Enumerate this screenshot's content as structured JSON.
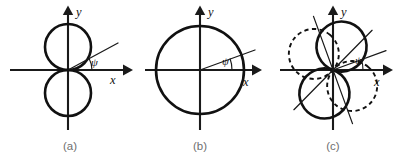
{
  "figure": {
    "background_color": "#ffffff",
    "stroke_color": "#111111",
    "caption_color": "#6f6f6f",
    "width": 401,
    "height": 159
  },
  "panels": [
    {
      "id": "panel-a",
      "caption": "(a)",
      "caption_x": 70,
      "caption_y": 150,
      "origin_x": 68,
      "origin_y": 70,
      "axes": {
        "x_label": "x",
        "y_label": "y",
        "x_label_x": 110,
        "x_label_y": 84,
        "y_label_x": 76,
        "y_label_y": 16,
        "x_start": 10,
        "x_end": 127,
        "y_start": 130,
        "y_end": 9
      },
      "angle_label": "ψ",
      "angle_label_x": 91,
      "angle_label_y": 66,
      "angle_degrees": 28,
      "ray_length": 54,
      "shape": {
        "type": "two-tangent-circles-vertical",
        "radius": 23,
        "upper_center_offset_y": -23,
        "lower_center_offset_y": 23,
        "rotation_degrees": 0
      }
    },
    {
      "id": "panel-b",
      "caption": "(b)",
      "caption_x": 200,
      "caption_y": 150,
      "origin_x": 200,
      "origin_y": 70,
      "axes": {
        "x_label": "x",
        "y_label": "y",
        "x_label_x": 243,
        "x_label_y": 86,
        "y_label_x": 208,
        "y_label_y": 16,
        "x_start": 145,
        "x_end": 258,
        "y_start": 130,
        "y_end": 9
      },
      "angle_label": "ψ",
      "angle_label_x": 222,
      "angle_label_y": 65,
      "angle_degrees": 20,
      "ray_length": 58,
      "shape": {
        "type": "circle-centered-origin",
        "radius": 44
      }
    },
    {
      "id": "panel-c",
      "caption": "(c)",
      "caption_x": 333,
      "caption_y": 150,
      "origin_x": 333,
      "origin_y": 70,
      "axes": {
        "x_label": "x",
        "y_label": "y",
        "x_label_x": 374,
        "x_label_y": 86,
        "y_label_x": 341,
        "y_label_y": 16,
        "x_start": 280,
        "x_end": 389,
        "y_start": 130,
        "y_end": 9
      },
      "angle_label": "ψ",
      "angle_label_x": 355,
      "angle_label_y": 64,
      "angle_degrees": 20,
      "ray_length": 56,
      "shape": {
        "type": "two-figure-eights-rotated",
        "radius": 25,
        "solid_rotation_degrees": 20,
        "dashed_rotation_degrees": -50
      },
      "extra_lines": [
        {
          "name": "diagonal-solid-axis",
          "angle_degrees": 20,
          "length": 56
        },
        {
          "name": "diagonal-dashed-axis",
          "angle_degrees": -50,
          "length": 52
        }
      ]
    }
  ]
}
